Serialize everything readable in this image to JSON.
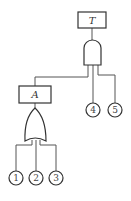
{
  "diagram": {
    "type": "fault-tree",
    "top_event": {
      "label": "T"
    },
    "and_gate": {
      "kind": "AND"
    },
    "intermediate_event": {
      "label": "A"
    },
    "or_gate": {
      "kind": "OR"
    },
    "basic_events": [
      {
        "label": "1"
      },
      {
        "label": "2"
      },
      {
        "label": "3"
      },
      {
        "label": "4"
      },
      {
        "label": "5"
      }
    ],
    "colors": {
      "stroke": "#333333",
      "background": "#ffffff"
    }
  }
}
